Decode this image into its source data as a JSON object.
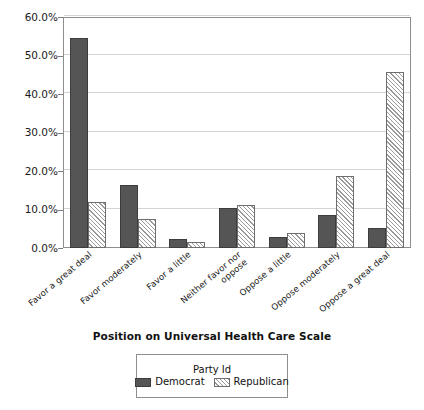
{
  "chart_data": {
    "type": "bar",
    "title": "",
    "xlabel": "Position on Universal Health Care Scale",
    "ylabel": "",
    "ylim": [
      0,
      60
    ],
    "ytick_labels": [
      "0.0%",
      "10.0%",
      "20.0%",
      "30.0%",
      "40.0%",
      "50.0%",
      "60.0%"
    ],
    "ytick_values": [
      0,
      10,
      20,
      30,
      40,
      50,
      60
    ],
    "grid": true,
    "legend_position": "bottom",
    "legend_title": "Party Id",
    "categories": [
      "Favor a great deal",
      "Favor moderately",
      "Favor a little",
      "Neither favor nor oppose",
      "Oppose a little",
      "Oppose moderately",
      "Oppose a great deal"
    ],
    "series": [
      {
        "name": "Democrat",
        "fill": "solid",
        "color": "#555555",
        "values": [
          54.5,
          16.3,
          2.3,
          10.4,
          2.8,
          8.7,
          5.2
        ]
      },
      {
        "name": "Republican",
        "fill": "hatched",
        "color": "#9a9a9a",
        "values": [
          11.9,
          7.6,
          1.5,
          11.1,
          3.8,
          18.6,
          45.6
        ]
      }
    ]
  }
}
